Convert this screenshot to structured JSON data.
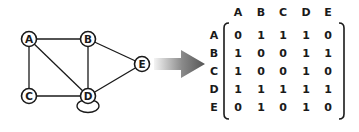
{
  "graph": {
    "nodes": [
      {
        "id": "A",
        "x": 29,
        "y": 39
      },
      {
        "id": "B",
        "x": 88,
        "y": 39
      },
      {
        "id": "C",
        "x": 29,
        "y": 96
      },
      {
        "id": "D",
        "x": 88,
        "y": 96
      },
      {
        "id": "E",
        "x": 142,
        "y": 64
      }
    ],
    "edges": [
      [
        "A",
        "B"
      ],
      [
        "A",
        "C"
      ],
      [
        "A",
        "D"
      ],
      [
        "B",
        "D"
      ],
      [
        "B",
        "E"
      ],
      [
        "C",
        "D"
      ],
      [
        "D",
        "E"
      ],
      [
        "D",
        "D"
      ]
    ],
    "self_loop": "D"
  },
  "arrow": {
    "direction": "right",
    "gradient_start": "#f2f2f2",
    "gradient_end": "#555555"
  },
  "matrix": {
    "column_headers": [
      "A",
      "B",
      "C",
      "D",
      "E"
    ],
    "row_headers": [
      "A",
      "B",
      "C",
      "D",
      "E"
    ],
    "rows": [
      [
        "0",
        "1",
        "1",
        "1",
        "0"
      ],
      [
        "1",
        "0",
        "0",
        "1",
        "1"
      ],
      [
        "1",
        "0",
        "0",
        "1",
        "0"
      ],
      [
        "1",
        "1",
        "1",
        "1",
        "1"
      ],
      [
        "0",
        "1",
        "0",
        "1",
        "0"
      ]
    ]
  },
  "colors": {
    "stroke": "#1a1a1a",
    "background": "#ffffff"
  }
}
